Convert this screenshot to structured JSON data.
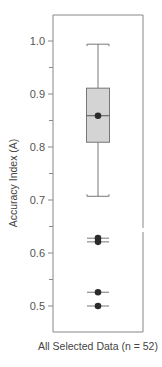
{
  "chart_data": {
    "type": "box",
    "title": "",
    "xlabel": "All Selected Data (n = 52)",
    "ylabel": "Accuracy Index (A)",
    "ylim": [
      0.45,
      1.05
    ],
    "yticks": [
      0.5,
      0.6,
      0.7,
      0.8,
      0.9,
      1.0
    ],
    "ytick_labels": [
      "0.5",
      "0.6",
      "0.7",
      "0.8",
      "0.9",
      "1.0"
    ],
    "minor_yticks": [
      0.55,
      0.65,
      0.75,
      0.85,
      0.95
    ],
    "grid": false,
    "legend": null,
    "categories": [
      "All Selected Data"
    ],
    "n": 52,
    "series": [
      {
        "name": "All Selected Data",
        "whisker_high": 0.994,
        "q3": 0.911,
        "median": 0.859,
        "q1": 0.809,
        "whisker_low": 0.707,
        "outliers": [
          0.628,
          0.621,
          0.526,
          0.5
        ]
      }
    ],
    "colors": {
      "box_fill": "#d4d4d4",
      "box_stroke": "#777777",
      "median_dot": "#2b2b2b",
      "frame": "#888888"
    }
  }
}
